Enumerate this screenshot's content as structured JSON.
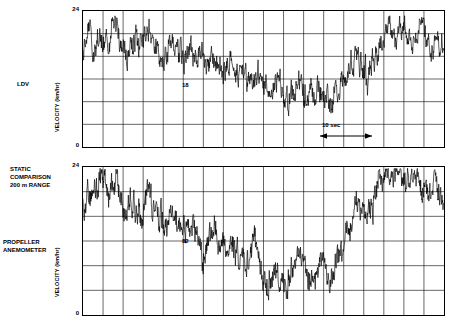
{
  "figure": {
    "annotation_static": [
      "STATIC",
      "COMPARISON",
      "200 m RANGE"
    ],
    "scale_bar_label": "10 sec"
  },
  "panels": [
    {
      "name": "ldv",
      "side_label": [
        "LDV"
      ],
      "inline_label": "18",
      "axis": {
        "ylabel": "VELOCITY  (km/hr)",
        "yticks": [
          "24",
          "0"
        ],
        "ymin": 0,
        "ymax": 24,
        "ygrid_count": 6,
        "xgrid_count": 18
      }
    },
    {
      "name": "propeller-anemometer",
      "side_label": [
        "PROPELLER",
        "ANEMOMETER"
      ],
      "inline_label": "82",
      "axis": {
        "ylabel": "VELOCITY  (km/hr)",
        "yticks": [
          "24",
          "0"
        ],
        "ymin": 0,
        "ymax": 24,
        "ygrid_count": 6,
        "xgrid_count": 18
      }
    }
  ],
  "chart_data": {
    "type": "line",
    "title": "",
    "subtitle": "",
    "xlabel": "time (10 sec per division marked by scale bar)",
    "ylabel": "VELOCITY (km/hr)",
    "ylim": [
      0,
      24
    ],
    "grid": true,
    "legend": "none",
    "series": [
      {
        "name": "LDV",
        "panel": "ldv",
        "note": "turbulent wind speed trace, noisy high-frequency signal",
        "x": [
          0,
          1,
          2,
          3,
          4,
          5,
          6,
          7,
          8,
          9,
          10,
          11,
          12,
          13,
          14,
          15,
          16,
          17,
          18,
          19,
          20,
          21,
          22,
          23,
          24,
          25,
          26,
          27,
          28,
          29,
          30,
          31,
          32,
          33,
          34,
          35,
          36,
          37,
          38,
          39,
          40,
          41,
          42,
          43,
          44,
          45,
          46,
          47,
          48,
          49,
          50,
          51,
          52,
          53,
          54,
          55,
          56,
          57,
          58,
          59,
          60,
          61,
          62,
          63,
          64,
          65,
          66,
          67,
          68,
          69,
          70,
          71,
          72,
          73,
          74,
          75,
          76,
          77,
          78,
          79,
          80,
          81,
          82,
          83,
          84,
          85,
          86,
          87,
          88,
          89,
          90,
          91,
          92,
          93,
          94,
          95,
          96,
          97,
          98,
          99
        ],
        "values": [
          17.5,
          18.2,
          19.0,
          18.1,
          19.6,
          20.4,
          19.2,
          18.4,
          19.8,
          20.6,
          19.4,
          18.0,
          17.2,
          18.6,
          19.9,
          18.8,
          17.6,
          18.9,
          20.1,
          19.3,
          18.2,
          17.0,
          16.2,
          17.4,
          18.6,
          17.8,
          16.5,
          15.6,
          14.8,
          15.9,
          17.1,
          16.3,
          15.2,
          14.4,
          15.5,
          16.8,
          15.9,
          14.6,
          13.5,
          12.6,
          13.8,
          15.0,
          14.1,
          12.9,
          11.8,
          10.9,
          12.1,
          13.4,
          12.5,
          11.3,
          10.2,
          9.4,
          10.6,
          11.9,
          11.0,
          9.8,
          8.8,
          9.9,
          11.2,
          12.4,
          11.5,
          10.3,
          9.2,
          8.4,
          9.6,
          10.8,
          10.0,
          8.9,
          8.0,
          9.2,
          10.5,
          11.8,
          13.0,
          14.2,
          15.4,
          16.6,
          15.7,
          14.5,
          13.6,
          14.8,
          16.1,
          17.4,
          18.6,
          19.8,
          20.9,
          19.7,
          18.5,
          19.8,
          21.0,
          20.2,
          19.0,
          20.3,
          21.5,
          20.6,
          19.4,
          18.2,
          17.3,
          18.5,
          19.7,
          18.8
        ],
        "ymax_reached": 23.5,
        "ymin_reached": 5.0
      },
      {
        "name": "PROPELLER ANEMOMETER",
        "panel": "propeller-anemometer",
        "note": "same wind event measured by propeller anemometer, smoother low-pass response",
        "x": [
          0,
          1,
          2,
          3,
          4,
          5,
          6,
          7,
          8,
          9,
          10,
          11,
          12,
          13,
          14,
          15,
          16,
          17,
          18,
          19,
          20,
          21,
          22,
          23,
          24,
          25,
          26,
          27,
          28,
          29,
          30,
          31,
          32,
          33,
          34,
          35,
          36,
          37,
          38,
          39,
          40,
          41,
          42,
          43,
          44,
          45,
          46,
          47,
          48,
          49,
          50,
          51,
          52,
          53,
          54,
          55,
          56,
          57,
          58,
          59,
          60,
          61,
          62,
          63,
          64,
          65,
          66,
          67,
          68,
          69,
          70,
          71,
          72,
          73,
          74,
          75,
          76,
          77,
          78,
          79,
          80,
          81,
          82,
          83,
          84,
          85,
          86,
          87,
          88,
          89,
          90,
          91,
          92,
          93,
          94,
          95,
          96,
          97,
          98,
          99
        ],
        "values": [
          18.0,
          19.5,
          20.8,
          19.4,
          20.6,
          21.8,
          20.4,
          19.0,
          20.2,
          21.4,
          20.0,
          18.6,
          17.4,
          18.8,
          20.0,
          18.7,
          17.3,
          18.6,
          19.8,
          18.5,
          17.1,
          15.8,
          14.6,
          15.9,
          17.2,
          16.0,
          14.7,
          13.5,
          12.4,
          13.6,
          14.9,
          13.7,
          12.5,
          11.4,
          12.6,
          13.9,
          12.7,
          11.5,
          10.4,
          9.3,
          10.6,
          11.9,
          10.7,
          9.5,
          8.4,
          7.3,
          8.6,
          9.9,
          8.7,
          7.5,
          6.4,
          5.3,
          6.6,
          7.9,
          6.8,
          5.6,
          4.5,
          6.0,
          7.5,
          9.0,
          8.0,
          6.9,
          5.9,
          5.0,
          6.5,
          8.0,
          7.2,
          6.2,
          5.4,
          7.0,
          8.8,
          10.6,
          12.4,
          14.2,
          16.0,
          17.8,
          16.9,
          15.7,
          16.9,
          18.4,
          19.9,
          21.2,
          22.4,
          23.0,
          22.2,
          21.0,
          22.0,
          23.0,
          22.2,
          21.2,
          22.2,
          23.2,
          22.4,
          21.4,
          20.4,
          19.4,
          20.6,
          21.8,
          20.8,
          19.6
        ],
        "ymax_reached": 24.0,
        "ymin_reached": 3.0
      }
    ]
  }
}
